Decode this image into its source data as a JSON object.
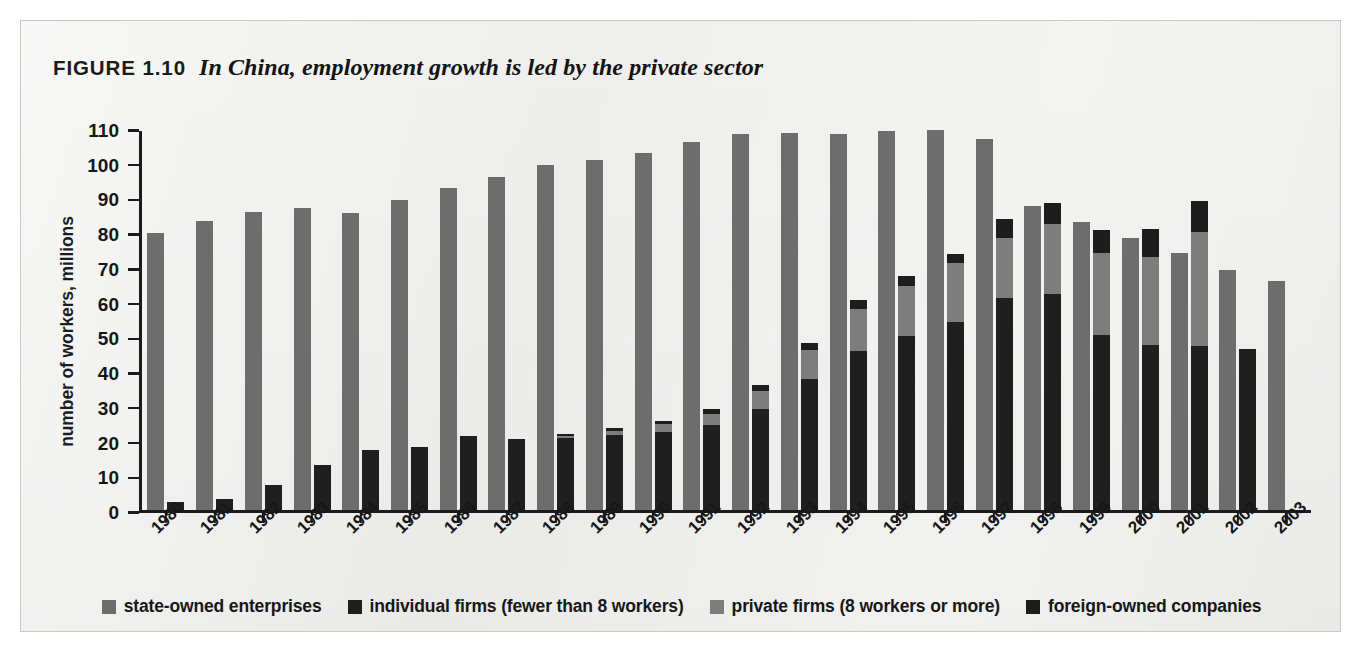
{
  "figure": {
    "label": "FIGURE 1.10",
    "title": "In China, employment growth is led by the private sector"
  },
  "colors": {
    "state_owned": "#6d6d6d",
    "individual": "#1f1f1f",
    "private": "#7d7d7d",
    "foreign": "#1d1d1d",
    "panel_background": "#eeeeec",
    "axis": "#1b1b1b"
  },
  "legend": {
    "items": [
      {
        "label": "state-owned enterprises",
        "swatch": "#6d6d6d",
        "key": "state_owned"
      },
      {
        "label": "individual firms (fewer than 8 workers)",
        "swatch": "#1f1f1f",
        "key": "individual"
      },
      {
        "label": "private firms (8 workers or more)",
        "swatch": "#7d7d7d",
        "key": "private"
      },
      {
        "label": "foreign-owned companies",
        "swatch": "#1d1d1d",
        "key": "foreign"
      }
    ]
  },
  "source_note": "",
  "chart_data": {
    "type": "bar",
    "subtype": "grouped-with-stacked-second-bar",
    "title": "In China, employment growth is led by the private sector",
    "xlabel": "",
    "ylabel": "number of workers, millions",
    "ylim": [
      0,
      110
    ],
    "ytick_values": [
      0,
      10,
      20,
      30,
      40,
      50,
      60,
      70,
      80,
      90,
      100,
      110
    ],
    "ytick_labels": [
      "0",
      "10",
      "20",
      "30",
      "40",
      "50",
      "60",
      "70",
      "80",
      "90",
      "100",
      "110"
    ],
    "grid": false,
    "legend_position": "bottom",
    "categories": [
      "1980",
      "1981",
      "1982",
      "1983",
      "1984",
      "1985",
      "1986",
      "1987",
      "1988",
      "1989",
      "1990",
      "1991",
      "1992",
      "1993",
      "1994",
      "1995",
      "1996",
      "1997",
      "1998",
      "1999",
      "2000",
      "2001",
      "2002",
      "2003"
    ],
    "series": [
      {
        "name": "state-owned enterprises",
        "color": "#6d6d6d",
        "stacked": false,
        "values": [
          80.5,
          83.8,
          86.5,
          87.8,
          86.3,
          89.9,
          93.5,
          96.6,
          100.1,
          101.5,
          103.5,
          106.8,
          109.2,
          109.5,
          109.2,
          110.0,
          110.2,
          107.7,
          88.4,
          83.6,
          79.0,
          74.7,
          69.8,
          66.6
        ]
      },
      {
        "name": "individual firms (fewer than 8 workers)",
        "color": "#1f1f1f",
        "stacked": true,
        "stack_order": 1,
        "values": [
          2.3,
          3.2,
          7.4,
          13.1,
          17.6,
          18.5,
          21.6,
          20.7,
          20.9,
          21.9,
          22.6,
          24.7,
          29.4,
          38.0,
          46.2,
          50.5,
          54.7,
          61.5,
          62.7,
          51.0,
          48.0,
          47.6,
          46.7,
          0
        ]
      },
      {
        "name": "private firms (8 workers or more)",
        "color": "#7d7d7d",
        "stacked": true,
        "stack_order": 2,
        "values": [
          0,
          0,
          0,
          0,
          0,
          0,
          0,
          0,
          0.6,
          1.2,
          2.4,
          3.3,
          5.2,
          8.5,
          12.3,
          14.5,
          17.1,
          17.5,
          20.3,
          23.6,
          25.5,
          33.0,
          0,
          0
        ]
      },
      {
        "name": "foreign-owned companies",
        "color": "#1d1d1d",
        "stacked": true,
        "stack_order": 3,
        "values": [
          0,
          0,
          0,
          0,
          0,
          0,
          0,
          0,
          0.7,
          0.9,
          1.0,
          1.3,
          1.7,
          2.1,
          2.6,
          3.0,
          2.5,
          5.5,
          6.0,
          6.8,
          8.2,
          9.0,
          0,
          0
        ]
      }
    ],
    "notes": [
      "Each year shows two bars: left bar = state-owned enterprises; right bar = stacked private-sector employment (individual firms at bottom, private firms, foreign-owned companies at top).",
      "Right-hand stack absent for 2003; state-owned bar continues to 2003."
    ]
  }
}
